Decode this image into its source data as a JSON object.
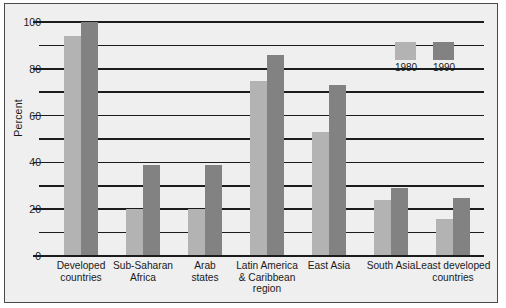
{
  "chart_data": {
    "type": "bar",
    "title": "",
    "xlabel": "",
    "ylabel": "Percent",
    "ylim": [
      0,
      100
    ],
    "grid": true,
    "legend_position": "inside-top-right",
    "y_ticks_major": [
      0,
      20,
      40,
      60,
      80,
      100
    ],
    "y_ticks_minor": [
      10,
      30,
      50,
      70,
      90
    ],
    "y_tick_labels": [
      "0",
      "20",
      "40",
      "60",
      "80",
      "100"
    ],
    "categories": [
      "Developed countries",
      "Sub-Saharan Africa",
      "Arab states",
      "Latin America & Caribbean region",
      "East Asia",
      "South Asia",
      "Least developed countries"
    ],
    "category_lines": [
      [
        "Developed",
        "countries"
      ],
      [
        "Sub-Saharan",
        "Africa"
      ],
      [
        "Arab",
        "states"
      ],
      [
        "Latin America",
        "& Caribbean",
        "region"
      ],
      [
        "East Asia"
      ],
      [
        "South Asia"
      ],
      [
        "Least developed",
        "countries"
      ]
    ],
    "series": [
      {
        "name": "1980",
        "color": "#b3b3b3",
        "values": [
          94,
          20,
          20,
          75,
          53,
          24,
          16
        ]
      },
      {
        "name": "1990",
        "color": "#828282",
        "values": [
          100,
          39,
          39,
          86,
          73,
          29,
          25
        ]
      }
    ]
  },
  "legend": {
    "items": [
      {
        "label": "1980",
        "color": "#b3b3b3"
      },
      {
        "label": "1990",
        "color": "#828282"
      }
    ]
  },
  "colors": {
    "series_1980": "#b3b3b3",
    "series_1990": "#828282",
    "axis": "#1c1c1c",
    "background": "#efefef",
    "border": "#4a4a4a"
  }
}
